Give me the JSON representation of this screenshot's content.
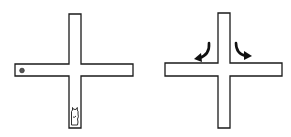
{
  "diagram": {
    "stroke_color": "#1a1a1a",
    "fill_color": "#ffffff",
    "panels": [
      {
        "name": "left-maze",
        "elements": [
          "start-marker-dot",
          "rat-figure-in-south-arm"
        ]
      },
      {
        "name": "right-maze",
        "elements": [
          "left-turn-arrow",
          "right-turn-arrow"
        ]
      }
    ]
  }
}
